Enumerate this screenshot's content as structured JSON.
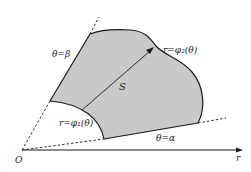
{
  "diagram": {
    "type": "polar-region",
    "colors": {
      "region_fill": "#c9c9c9",
      "stroke": "#1a1a1a",
      "background": "#ffffff"
    },
    "labels": {
      "origin": "O",
      "axis": "r",
      "ray_beta": "θ=β",
      "ray_alpha": "θ=α",
      "outer_curve": "r=φ₂(θ)",
      "inner_curve": "r=φ₁(θ)",
      "region": "S"
    }
  }
}
